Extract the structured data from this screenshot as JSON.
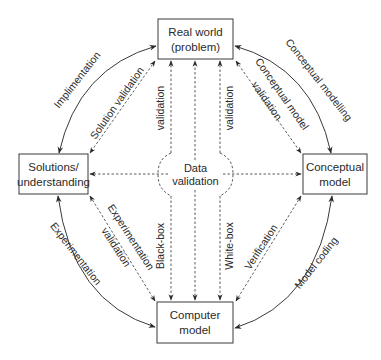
{
  "diagram": {
    "nodes": {
      "real_world": {
        "line1": "Real world",
        "line2": "(problem)"
      },
      "solutions": {
        "line1": "Solutions/",
        "line2": "understanding"
      },
      "conceptual": {
        "line1": "Conceptual",
        "line2": "model"
      },
      "computer": {
        "line1": "Computer",
        "line2": "model"
      }
    },
    "edges": {
      "implementation": "Implimentation",
      "solution_validation": "Solution validation",
      "conceptual_modelling": "Conceptual modelling",
      "conceptual_model_validation_1": "Conceptual model",
      "conceptual_model_validation_2": "validation",
      "experimentation": "Experimentation",
      "experimentation_validation_1": "Experimentation",
      "experimentation_validation_2": "validation",
      "model_coding": "Model coding",
      "verification": "Verification",
      "validation_left": "validation",
      "validation_right": "validation",
      "black_box": "Black-box",
      "white_box": "White-box"
    },
    "center": {
      "line1": "Data",
      "line2": "validation"
    }
  }
}
